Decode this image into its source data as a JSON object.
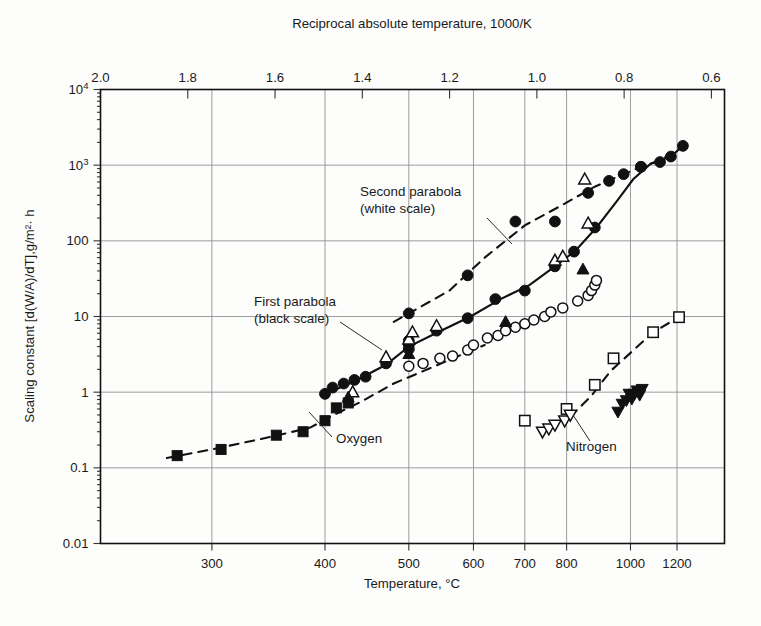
{
  "chart_data": {
    "type": "scatter",
    "title": "",
    "xlabel": "Temperature, °C",
    "ylabel": "Scaling constant [d(W/A)/dT],g/m²· h",
    "top_axis_label": "Reciprocal absolute temperature, 1000/K",
    "grid": true,
    "legend_position": "inline-annotations",
    "yscale": "log",
    "ylim": [
      0.01,
      10000
    ],
    "ytick_labels": [
      "10⁴",
      "10³",
      "100",
      "10",
      "1",
      "0.1",
      "0.01"
    ],
    "ytick_values": [
      10000,
      1000,
      100,
      10,
      1,
      0.1,
      0.01
    ],
    "xscale": "reciprocal-absolute-temperature",
    "xtick_labels_bottom": [
      "300",
      "400",
      "500",
      "600",
      "700",
      "800",
      "1000",
      "1200"
    ],
    "xtick_values_bottom": [
      300,
      400,
      500,
      600,
      700,
      800,
      1000,
      1200
    ],
    "xtick_labels_top": [
      "2.0",
      "1.8",
      "1.6",
      "1.4",
      "1.2",
      "1.0",
      "0.8",
      "0.6"
    ],
    "xtick_values_top": [
      2.0,
      1.8,
      1.6,
      1.4,
      1.2,
      1.0,
      0.8,
      0.6
    ],
    "xlim_top": [
      2.0,
      0.57
    ],
    "annotations": [
      {
        "id": "second-parabola",
        "text_line1": "Second parabola",
        "text_line2": "(white scale)"
      },
      {
        "id": "first-parabola",
        "text_line1": "First parabola",
        "text_line2": "(black scale)"
      },
      {
        "id": "oxygen",
        "text_line1": "Oxygen",
        "text_line2": ""
      },
      {
        "id": "nitrogen",
        "text_line1": "Nitrogen",
        "text_line2": ""
      }
    ],
    "series": [
      {
        "name": "Second parabola (white scale) — filled circles",
        "marker": "filled-circle",
        "curve": "dashed",
        "points": [
          {
            "t": 500,
            "y": 11
          },
          {
            "t": 590,
            "y": 35
          },
          {
            "t": 680,
            "y": 180
          },
          {
            "t": 770,
            "y": 180
          },
          {
            "t": 860,
            "y": 430
          },
          {
            "t": 925,
            "y": 620
          },
          {
            "t": 975,
            "y": 760
          },
          {
            "t": 1040,
            "y": 950
          },
          {
            "t": 1230,
            "y": 1800
          }
        ]
      },
      {
        "name": "First parabola (black scale) — filled circles",
        "marker": "filled-circle",
        "curve": "solid",
        "points": [
          {
            "t": 400,
            "y": 0.95
          },
          {
            "t": 408,
            "y": 1.15
          },
          {
            "t": 420,
            "y": 1.3
          },
          {
            "t": 432,
            "y": 1.45
          },
          {
            "t": 445,
            "y": 1.6
          },
          {
            "t": 470,
            "y": 2.4
          },
          {
            "t": 500,
            "y": 3.7
          },
          {
            "t": 500,
            "y": 4.2
          },
          {
            "t": 500,
            "y": 4.8
          },
          {
            "t": 540,
            "y": 6.5
          },
          {
            "t": 590,
            "y": 9.5
          },
          {
            "t": 640,
            "y": 17
          },
          {
            "t": 700,
            "y": 22
          },
          {
            "t": 770,
            "y": 46
          },
          {
            "t": 820,
            "y": 72
          },
          {
            "t": 880,
            "y": 150
          },
          {
            "t": 1040,
            "y": 950
          },
          {
            "t": 1120,
            "y": 1100
          },
          {
            "t": 1170,
            "y": 1300
          }
        ]
      },
      {
        "name": "Oxygen — filled squares",
        "marker": "filled-square",
        "curve": "dashed-lower",
        "points": [
          {
            "t": 275,
            "y": 0.145
          },
          {
            "t": 307,
            "y": 0.175
          },
          {
            "t": 353,
            "y": 0.27
          },
          {
            "t": 378,
            "y": 0.3
          },
          {
            "t": 400,
            "y": 0.42
          },
          {
            "t": 412,
            "y": 0.62
          },
          {
            "t": 425,
            "y": 0.72
          }
        ]
      },
      {
        "name": "Oxygen — open circles",
        "marker": "open-circle",
        "points": [
          {
            "t": 500,
            "y": 2.2
          },
          {
            "t": 520,
            "y": 2.4
          },
          {
            "t": 545,
            "y": 2.8
          },
          {
            "t": 565,
            "y": 3.0
          },
          {
            "t": 590,
            "y": 3.6
          },
          {
            "t": 600,
            "y": 4.2
          },
          {
            "t": 625,
            "y": 5.2
          },
          {
            "t": 645,
            "y": 5.6
          },
          {
            "t": 660,
            "y": 6.5
          },
          {
            "t": 680,
            "y": 7.2
          },
          {
            "t": 700,
            "y": 8.0
          },
          {
            "t": 720,
            "y": 9.0
          },
          {
            "t": 745,
            "y": 10.0
          },
          {
            "t": 760,
            "y": 11.5
          },
          {
            "t": 790,
            "y": 13.0
          },
          {
            "t": 830,
            "y": 16.0
          },
          {
            "t": 860,
            "y": 19.0
          },
          {
            "t": 870,
            "y": 22.0
          },
          {
            "t": 880,
            "y": 26.0
          },
          {
            "t": 885,
            "y": 30.0
          }
        ]
      },
      {
        "name": "Oxygen — open triangles (up)",
        "marker": "open-triangle-up",
        "points": [
          {
            "t": 430,
            "y": 1.0
          },
          {
            "t": 470,
            "y": 2.9
          },
          {
            "t": 500,
            "y": 5.0
          },
          {
            "t": 505,
            "y": 6.2
          },
          {
            "t": 540,
            "y": 7.5
          },
          {
            "t": 770,
            "y": 55
          },
          {
            "t": 790,
            "y": 62
          },
          {
            "t": 850,
            "y": 650
          },
          {
            "t": 860,
            "y": 170
          }
        ]
      },
      {
        "name": "Oxygen — filled triangles (up)",
        "marker": "filled-triangle-up",
        "points": [
          {
            "t": 425,
            "y": 0.85
          },
          {
            "t": 500,
            "y": 3.2
          },
          {
            "t": 660,
            "y": 8.5
          },
          {
            "t": 845,
            "y": 42
          }
        ]
      },
      {
        "name": "Nitrogen — open squares",
        "marker": "open-square",
        "points": [
          {
            "t": 700,
            "y": 0.42
          },
          {
            "t": 800,
            "y": 0.6
          },
          {
            "t": 880,
            "y": 1.25
          },
          {
            "t": 940,
            "y": 2.8
          },
          {
            "t": 1090,
            "y": 6.2
          },
          {
            "t": 1210,
            "y": 9.8
          }
        ]
      },
      {
        "name": "Nitrogen — open triangles (down)",
        "marker": "open-triangle-down",
        "points": [
          {
            "t": 740,
            "y": 0.3
          },
          {
            "t": 755,
            "y": 0.33
          },
          {
            "t": 770,
            "y": 0.37
          },
          {
            "t": 795,
            "y": 0.42
          },
          {
            "t": 810,
            "y": 0.5
          }
        ]
      },
      {
        "name": "Nitrogen — filled triangles (down)",
        "marker": "filled-triangle-down",
        "points": [
          {
            "t": 955,
            "y": 0.55
          },
          {
            "t": 970,
            "y": 0.7
          },
          {
            "t": 985,
            "y": 0.78
          },
          {
            "t": 995,
            "y": 0.95
          },
          {
            "t": 1005,
            "y": 0.82
          },
          {
            "t": 1015,
            "y": 0.95
          },
          {
            "t": 1025,
            "y": 1.05
          },
          {
            "t": 1035,
            "y": 0.92
          },
          {
            "t": 1045,
            "y": 1.1
          }
        ]
      }
    ]
  },
  "colors": {
    "ink": "#111111",
    "grid": "#8d8d8d",
    "background": "#fdfdfc",
    "marker_fill": "#111111",
    "marker_open": "#ffffff"
  }
}
